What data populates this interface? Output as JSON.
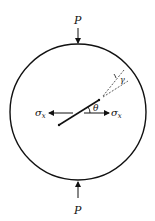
{
  "diagram": {
    "labels": {
      "load_top": "P",
      "load_bottom": "P",
      "stress_left": "σx",
      "stress_right": "σx",
      "crack_angle": "θ",
      "kink_angle": "γ"
    },
    "colors": {
      "stroke": "#111111",
      "background": "#ffffff"
    }
  }
}
